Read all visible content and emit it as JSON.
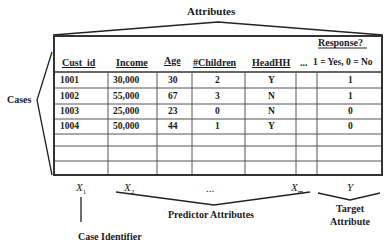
{
  "title": "Attributes",
  "left_label": "Cases",
  "table": {
    "columns": [
      "Cust_id",
      "Income",
      "Age",
      "#Children",
      "HeadHH",
      "...",
      "1 = Yes, 0 = No"
    ],
    "response_header": "Response?",
    "rows": [
      [
        "1001",
        "30,000",
        "30",
        "2",
        "Y",
        "",
        "1"
      ],
      [
        "1002",
        "55,000",
        "67",
        "3",
        "N",
        "",
        "1"
      ],
      [
        "1003",
        "25,000",
        "23",
        "0",
        "N",
        "",
        "0"
      ],
      [
        "1004",
        "50,000",
        "44",
        "1",
        "Y",
        "",
        "0"
      ],
      [
        "",
        "",
        "",
        "",
        "",
        "",
        ""
      ],
      [
        "",
        "",
        "",
        "",
        "",
        "",
        ""
      ]
    ]
  },
  "variables": {
    "x1": "X",
    "x1_sub": "1",
    "x2": "X",
    "x2_sub": "2",
    "ellipsis": "...",
    "xm": "X",
    "xm_sub": "m",
    "y": "Y"
  },
  "annotations": {
    "predictor": "Predictor Attributes",
    "target_line1": "Target",
    "target_line2": "Attribute",
    "case_identifier": "Case Identifier"
  }
}
